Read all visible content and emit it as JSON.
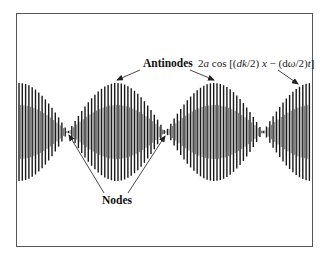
{
  "figure": {
    "frame": {
      "x": 16,
      "y": 13,
      "width": 296,
      "height": 233,
      "stroke": "#555555"
    },
    "wave": {
      "x_start": 19,
      "x_end": 311,
      "center_y": 132,
      "amplitude": 49,
      "node_positions_x": [
        68,
        166,
        262
      ],
      "envelope_period_px": 195,
      "carrier_period_px": 3.3,
      "color": "#1a1a1a"
    },
    "labels": {
      "antinodes": "Antinodes",
      "nodes": "Nodes",
      "formula": {
        "coef": "2",
        "a": "a",
        "cos": " cos [(",
        "dk": "dk",
        "div1": "/2) ",
        "x": "x",
        "minus": " − (d",
        "omega": "ω",
        "div2": "/2)",
        "t": "t",
        "close": "]"
      }
    },
    "arrows": [
      {
        "name": "antinode-arrow-left",
        "from": [
          140,
          70
        ],
        "to": [
          117,
          80
        ]
      },
      {
        "name": "antinode-arrow-middle",
        "from": [
          190,
          70
        ],
        "to": [
          214,
          80
        ]
      },
      {
        "name": "envelope-arrow",
        "from": [
          278,
          70
        ],
        "to": [
          298,
          84
        ]
      },
      {
        "name": "node-arrow-left",
        "from": [
          104,
          193
        ],
        "to": [
          69,
          135
        ]
      },
      {
        "name": "node-arrow-right",
        "from": [
          128,
          193
        ],
        "to": [
          165,
          136
        ]
      }
    ]
  }
}
